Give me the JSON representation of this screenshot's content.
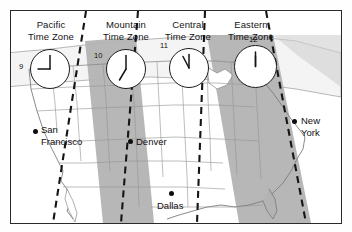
{
  "figure": {
    "frame_color": "#2b2b2b",
    "background_color": "#ffffff",
    "land_fill_light": "#ffffff",
    "land_fill_shaded": "#b3b3b3",
    "state_border_color": "#8a8a8a",
    "zone_boundary_color": "#1a1a1a"
  },
  "zones": [
    {
      "id": "pacific",
      "label_line1": "Pacific",
      "label_line2": "Time Zone",
      "shaded": false,
      "clock": {
        "hour_label": "9",
        "hour_hand_deg": 270,
        "minute_hand_deg": 0,
        "label_position": "left"
      }
    },
    {
      "id": "mountain",
      "label_line1": "Mountain",
      "label_line2": "Time Zone",
      "shaded": true,
      "clock": {
        "hour_label": "10",
        "hour_hand_deg": 300,
        "minute_hand_deg": 0,
        "label_position": "upper-left"
      }
    },
    {
      "id": "central",
      "label_line1": "Central",
      "label_line2": "Time Zone",
      "shaded": false,
      "clock": {
        "hour_label": "11",
        "hour_hand_deg": 330,
        "minute_hand_deg": 0,
        "label_position": "upper-left"
      }
    },
    {
      "id": "eastern",
      "label_line1": "Eastern",
      "label_line2": "Time Zone",
      "shaded": true,
      "clock": {
        "hour_label": "12",
        "hour_hand_deg": 0,
        "minute_hand_deg": 0,
        "label_position": "top"
      }
    }
  ],
  "cities": [
    {
      "id": "san-francisco",
      "name_line1": "San",
      "name_line2": "Francisco",
      "zone": "pacific"
    },
    {
      "id": "denver",
      "name_line1": "Denver",
      "name_line2": "",
      "zone": "mountain"
    },
    {
      "id": "dallas",
      "name_line1": "Dallas",
      "name_line2": "",
      "zone": "central"
    },
    {
      "id": "new-york",
      "name_line1": "New",
      "name_line2": "York",
      "zone": "eastern"
    }
  ]
}
